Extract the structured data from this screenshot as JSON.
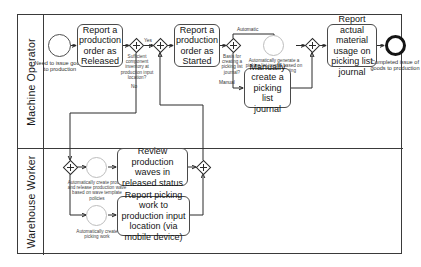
{
  "diagram": {
    "type": "bpmn-swimlane-flowchart",
    "lanes": [
      {
        "id": "machine-operator",
        "label": "Machine Operator"
      },
      {
        "id": "warehouse-worker",
        "label": "Warehouse Worker"
      }
    ],
    "colors": {
      "border": "#3a3a3a",
      "task_border": "#4a4a4a",
      "line": "#2b2b2b",
      "background": "#ffffff",
      "text": "#141414"
    }
  },
  "events": {
    "start_need": {
      "kind": "start-event",
      "label": "Need to issue goods to production"
    },
    "end_completed": {
      "kind": "end-event",
      "label": "Completed issue of goods to production"
    },
    "auto_generate_picking": {
      "kind": "intermediate-event",
      "label": "Automatically generate a picking list journal based on Start/Stop job posting"
    },
    "auto_create_wave": {
      "kind": "intermediate-event",
      "label": "Automatically create process and release production wave based on wave template policies"
    },
    "auto_create_work": {
      "kind": "intermediate-event",
      "label": "Automatically create picking work"
    }
  },
  "tasks": {
    "report_released": {
      "label": "Report a production order as Released"
    },
    "report_started": {
      "label": "Report a production order as Started"
    },
    "manual_picking_journal": {
      "label": "Manually create a picking list journal"
    },
    "report_material_usage": {
      "label": "Report actual material usage on picking list journal"
    },
    "review_waves": {
      "label": "Review production waves in released status"
    },
    "report_picking_work": {
      "label": "Report picking work to production input location (via mobile device)"
    }
  },
  "gateways": {
    "gw_inventory": {
      "kind": "exclusive-gateway",
      "label": "Sufficient component inventory at production input location?"
    },
    "gw_join_started": {
      "kind": "parallel-gateway",
      "label": ""
    },
    "gw_basis": {
      "kind": "exclusive-gateway",
      "label": "Basis for creating a picking list journal?"
    },
    "gw_join_journal": {
      "kind": "parallel-gateway",
      "label": ""
    },
    "gw_wh_split": {
      "kind": "parallel-gateway",
      "label": ""
    },
    "gw_wh_join": {
      "kind": "parallel-gateway",
      "label": ""
    }
  },
  "flow_labels": {
    "yes": "Yes",
    "no": "No",
    "automatic": "Automatic",
    "manual": "Manual"
  }
}
